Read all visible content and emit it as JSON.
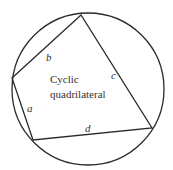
{
  "title": "Cyclic quadrilateral",
  "caption_lines": [
    "Cyclic",
    "quadrilateral"
  ],
  "circle": {
    "cx": 88,
    "cy": 89,
    "r": 76
  },
  "vertices": [
    {
      "x": 81,
      "y": 15
    },
    {
      "x": 12,
      "y": 78
    },
    {
      "x": 33,
      "y": 140
    },
    {
      "x": 152,
      "y": 128
    }
  ],
  "sides": [
    {
      "name": "a",
      "label": "a",
      "x": 27,
      "y": 112
    },
    {
      "name": "b",
      "label": "b",
      "x": 46,
      "y": 61
    },
    {
      "name": "c",
      "label": "c",
      "x": 111,
      "y": 79
    },
    {
      "name": "d",
      "label": "d",
      "x": 85,
      "y": 132
    }
  ],
  "colors": {
    "stroke": "#2b2b2b",
    "text": "#333333",
    "background": "#ffffff"
  }
}
